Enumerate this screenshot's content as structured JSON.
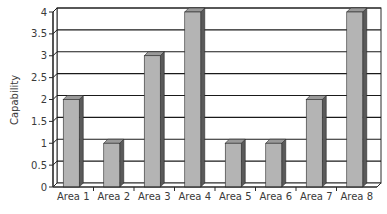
{
  "chart_data": {
    "type": "bar",
    "style": "3d-column",
    "title": "",
    "xlabel": "",
    "ylabel": "Capability",
    "categories": [
      "Area 1",
      "Area 2",
      "Area 3",
      "Area 4",
      "Area 5",
      "Area 6",
      "Area 7",
      "Area 8"
    ],
    "values": [
      2,
      1,
      3,
      4,
      1,
      1,
      2,
      4
    ],
    "ylim": [
      0,
      4
    ],
    "yticks": [
      0,
      0.5,
      1,
      1.5,
      2,
      2.5,
      3,
      3.5,
      4
    ],
    "ytick_labels": [
      "0",
      "0.5",
      "1",
      "1.5",
      "2",
      "2.5",
      "3",
      "3.5",
      "4"
    ],
    "grid": true,
    "legend": "none",
    "colors": {
      "bar_front": "#b4b4b4",
      "bar_side": "#5a5a5a",
      "bar_top": "#9a9a9a",
      "gridline": "#1a1a1a",
      "axis": "#2a2a2a"
    }
  }
}
